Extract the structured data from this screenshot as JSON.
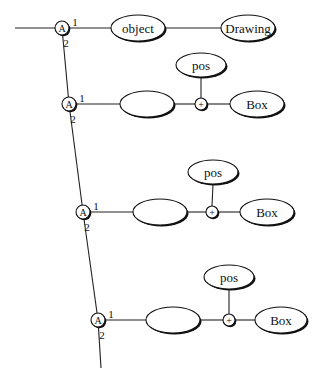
{
  "diagram": {
    "incoming_edge": {
      "x1": 15,
      "y1": 28
    },
    "spine": [
      {
        "x": 62,
        "y": 28
      },
      {
        "x": 69,
        "y": 104
      },
      {
        "x": 83,
        "y": 212
      },
      {
        "x": 98,
        "y": 320
      }
    ],
    "spine_end": {
      "x": 101,
      "y": 368
    },
    "rows": [
      {
        "apply_node": {
          "label": "A",
          "x": 62,
          "y": 28,
          "port1": "1",
          "port2": "2"
        },
        "first_node": {
          "label": "object",
          "cx": 138,
          "cy": 28,
          "rx": 27,
          "ry": 13
        },
        "plus_node": null,
        "pos_node": null,
        "last_node": {
          "label": "Drawing",
          "cx": 248,
          "cy": 28,
          "rx": 27,
          "ry": 13
        }
      },
      {
        "apply_node": {
          "label": "A",
          "x": 69,
          "y": 104,
          "port1": "1",
          "port2": "2"
        },
        "first_node": {
          "label": "",
          "cx": 147,
          "cy": 104,
          "rx": 27,
          "ry": 13
        },
        "plus_node": {
          "label": "+",
          "x": 201,
          "y": 104
        },
        "pos_node": {
          "label": "pos",
          "cx": 201,
          "cy": 65,
          "rx": 25,
          "ry": 12
        },
        "last_node": {
          "label": "Box",
          "cx": 257,
          "cy": 104,
          "rx": 27,
          "ry": 13
        }
      },
      {
        "apply_node": {
          "label": "A",
          "x": 83,
          "y": 212,
          "port1": "1",
          "port2": "2"
        },
        "first_node": {
          "label": "",
          "cx": 160,
          "cy": 212,
          "rx": 27,
          "ry": 13
        },
        "plus_node": {
          "label": "+",
          "x": 212,
          "y": 212
        },
        "pos_node": {
          "label": "pos",
          "cx": 213,
          "cy": 172,
          "rx": 25,
          "ry": 12
        },
        "last_node": {
          "label": "Box",
          "cx": 267,
          "cy": 212,
          "rx": 27,
          "ry": 13
        }
      },
      {
        "apply_node": {
          "label": "A",
          "x": 98,
          "y": 320,
          "port1": "1",
          "port2": "2"
        },
        "first_node": {
          "label": "",
          "cx": 173,
          "cy": 320,
          "rx": 27,
          "ry": 13
        },
        "plus_node": {
          "label": "+",
          "x": 229,
          "y": 320
        },
        "pos_node": {
          "label": "pos",
          "cx": 229,
          "cy": 277,
          "rx": 25,
          "ry": 12
        },
        "last_node": {
          "label": "Box",
          "cx": 281,
          "cy": 320,
          "rx": 26,
          "ry": 13
        }
      }
    ]
  }
}
